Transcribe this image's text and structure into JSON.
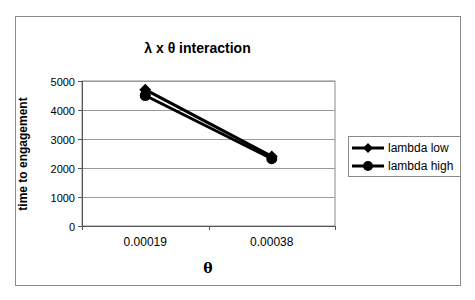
{
  "chart_data": {
    "type": "line",
    "title": "λ x θ   interaction",
    "xlabel": "θ",
    "ylabel": "time to engagement",
    "categories": [
      "0.00019",
      "0.00038"
    ],
    "series": [
      {
        "name": "lambda low",
        "marker": "diamond",
        "values": [
          4700,
          2400
        ]
      },
      {
        "name": "lambda high",
        "marker": "circle",
        "values": [
          4500,
          2320
        ]
      }
    ],
    "ylim": [
      0,
      5000
    ],
    "yticks": [
      "0",
      "1000",
      "2000",
      "3000",
      "4000",
      "5000"
    ],
    "grid": true,
    "legend_position": "right",
    "colors": {
      "line": "#000000",
      "grid": "#9a9a9a",
      "border": "#8a8a8a"
    }
  }
}
